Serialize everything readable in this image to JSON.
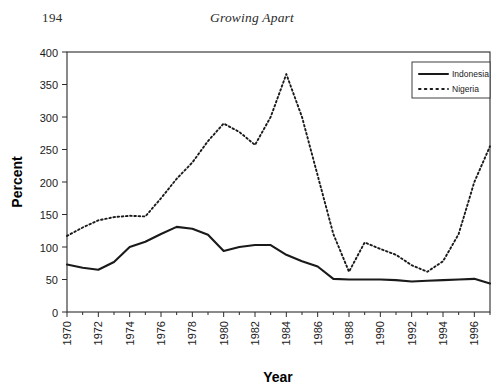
{
  "page": {
    "folio": "194",
    "book_title": "Growing Apart"
  },
  "legend": {
    "position": "top-right",
    "entries": [
      {
        "label": "Indonesia",
        "style": "solid",
        "color": "#1a1a1a"
      },
      {
        "label": "Nigeria",
        "style": "dotted",
        "color": "#1a1a1a"
      }
    ]
  },
  "chart_data": {
    "type": "line",
    "title": "",
    "xlabel": "Year",
    "ylabel": "Percent",
    "xlim": [
      1970,
      1997
    ],
    "ylim": [
      0,
      400
    ],
    "ytick_step": 50,
    "xtick_step": 2,
    "grid": false,
    "legend_position": "top-right",
    "yticks": [
      0,
      50,
      100,
      150,
      200,
      250,
      300,
      350,
      400
    ],
    "xticks": [
      1970,
      1972,
      1974,
      1976,
      1978,
      1980,
      1982,
      1984,
      1986,
      1988,
      1990,
      1992,
      1994,
      1996
    ],
    "xticklabels": [
      "1970",
      "1972",
      "1974",
      "1976",
      "1978",
      "1980",
      "1982",
      "1984",
      "1986",
      "1988",
      "1990",
      "1992",
      "1994",
      "1996"
    ],
    "yticklabels": [
      "0",
      "50",
      "100",
      "150",
      "200",
      "250",
      "300",
      "350",
      "400"
    ],
    "x": [
      1970,
      1971,
      1972,
      1973,
      1974,
      1975,
      1976,
      1977,
      1978,
      1979,
      1980,
      1981,
      1982,
      1983,
      1984,
      1985,
      1986,
      1987,
      1988,
      1989,
      1990,
      1991,
      1992,
      1993,
      1994,
      1995,
      1996,
      1997
    ],
    "series": [
      {
        "name": "Indonesia",
        "style": "solid",
        "color": "#1a1a1a",
        "values": [
          73,
          68,
          65,
          77,
          100,
          108,
          120,
          131,
          128,
          119,
          94,
          100,
          103,
          103,
          88,
          78,
          70,
          51,
          50,
          50,
          50,
          49,
          47,
          48,
          49,
          50,
          51,
          44
        ]
      },
      {
        "name": "Nigeria",
        "style": "dotted",
        "color": "#1a1a1a",
        "values": [
          117,
          130,
          141,
          146,
          148,
          147,
          175,
          205,
          230,
          263,
          290,
          277,
          257,
          300,
          366,
          300,
          210,
          120,
          62,
          107,
          97,
          88,
          72,
          62,
          78,
          120,
          200,
          255
        ]
      }
    ]
  }
}
